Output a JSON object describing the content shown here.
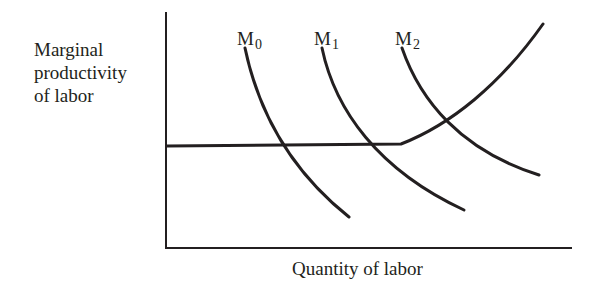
{
  "diagram": {
    "y_axis_label_lines": [
      "Marginal",
      "productivity",
      "of labor"
    ],
    "x_axis_label": "Quantity of labor",
    "curves": [
      {
        "id": "M0",
        "label_base": "M",
        "label_sub": "0",
        "label_x": 237,
        "label_y": 28,
        "path": "M 245 48 C 258 110, 290 170, 349 217"
      },
      {
        "id": "M1",
        "label_base": "M",
        "label_sub": "1",
        "label_x": 314,
        "label_y": 28,
        "path": "M 322 48 C 335 110, 378 170, 464 210"
      },
      {
        "id": "M2",
        "label_base": "M",
        "label_sub": "2",
        "label_x": 395,
        "label_y": 28,
        "path": "M 402 48 C 420 100, 460 150, 539 175"
      }
    ],
    "supply_curve": {
      "name": "Labor supply (flat then rising)",
      "path": "M 167 146 L 401 144 C 450 125, 500 85, 543 24"
    },
    "axes": {
      "origin_x": 166,
      "origin_y": 248,
      "y_top": 12,
      "x_right": 572
    },
    "stroke_color": "#231f20"
  }
}
